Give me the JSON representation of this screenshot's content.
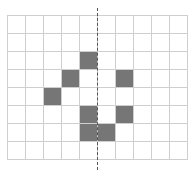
{
  "grid": {
    "rows": 8,
    "cols": 10,
    "cell_size": 18,
    "fill_color": "#767676",
    "line_color": "#cfcfcf",
    "filled_cells": [
      [
        2,
        4
      ],
      [
        3,
        3
      ],
      [
        3,
        6
      ],
      [
        4,
        2
      ],
      [
        5,
        4
      ],
      [
        5,
        6
      ],
      [
        6,
        4
      ],
      [
        6,
        5
      ]
    ]
  },
  "symmetry_axis": {
    "style": "dashed",
    "orientation": "vertical",
    "position_after_col": 5,
    "color": "#555555"
  }
}
